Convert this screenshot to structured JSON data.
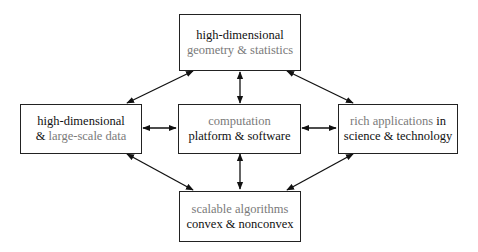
{
  "diagram": {
    "title": "",
    "nodes": {
      "top": {
        "line1": [
          {
            "text": "high-dimensional",
            "style": "dark"
          }
        ],
        "line2": [
          {
            "text": "geometry & statistics",
            "style": "gray"
          }
        ]
      },
      "left": {
        "line1": [
          {
            "text": "high-dimensional",
            "style": "dark"
          }
        ],
        "line2": [
          {
            "text": "& ",
            "style": "dark"
          },
          {
            "text": "large-scale data",
            "style": "gray"
          }
        ]
      },
      "center": {
        "line1": [
          {
            "text": "computation",
            "style": "gray"
          }
        ],
        "line2": [
          {
            "text": "platform & software",
            "style": "dark"
          }
        ]
      },
      "right": {
        "line1": [
          {
            "text": "rich applications ",
            "style": "gray"
          },
          {
            "text": "in",
            "style": "dark"
          }
        ],
        "line2": [
          {
            "text": "science & technology",
            "style": "dark"
          }
        ]
      },
      "bottom": {
        "line1": [
          {
            "text": "scalable algorithms",
            "style": "gray"
          }
        ],
        "line2": [
          {
            "text": "convex & nonconvex",
            "style": "dark"
          }
        ]
      }
    },
    "edges": [
      {
        "from": "top",
        "to": "left",
        "type": "bidirectional"
      },
      {
        "from": "top",
        "to": "center",
        "type": "bidirectional"
      },
      {
        "from": "top",
        "to": "right",
        "type": "bidirectional"
      },
      {
        "from": "left",
        "to": "center",
        "type": "bidirectional"
      },
      {
        "from": "center",
        "to": "right",
        "type": "bidirectional"
      },
      {
        "from": "left",
        "to": "bottom",
        "type": "bidirectional"
      },
      {
        "from": "center",
        "to": "bottom",
        "type": "bidirectional"
      },
      {
        "from": "right",
        "to": "bottom",
        "type": "bidirectional"
      }
    ],
    "colors": {
      "border": "#222222",
      "text_dark": "#111111",
      "text_gray": "#7a7a7a",
      "arrow": "#111111"
    }
  }
}
